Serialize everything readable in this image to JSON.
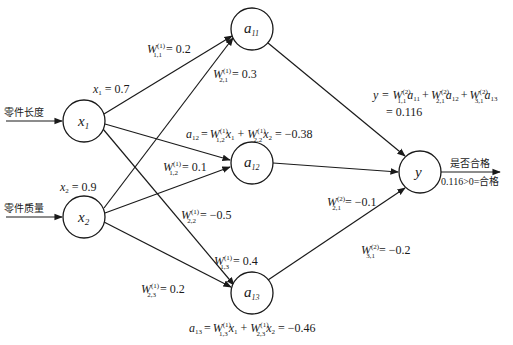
{
  "diagram": {
    "inputs": [
      {
        "id": "x1",
        "label_main": "x",
        "label_sub": "1",
        "feature": "零件长度",
        "value_text": "x",
        "value_sub": "1",
        "value": "= 0.7"
      },
      {
        "id": "x2",
        "label_main": "x",
        "label_sub": "2",
        "feature": "零件质量",
        "value_text": "x",
        "value_sub": "2",
        "value": "= 0.9"
      }
    ],
    "hidden": [
      {
        "id": "a11",
        "label_main": "a",
        "label_sub": "11"
      },
      {
        "id": "a12",
        "label_main": "a",
        "label_sub": "12",
        "formula": {
          "lhs": "a",
          "lhs_sub": "12",
          "t1": "W",
          "t1_sub": "1,2",
          "t1_sup": "(1)",
          "v1": "x",
          "v1_sub": "1",
          "t2": "W",
          "t2_sub": "2,2",
          "t2_sup": "(1)",
          "v2": "x",
          "v2_sub": "2",
          "result": "= −0.38"
        }
      },
      {
        "id": "a13",
        "label_main": "a",
        "label_sub": "13",
        "formula": {
          "lhs": "a",
          "lhs_sub": "13",
          "t1": "W",
          "t1_sub": "1,3",
          "t1_sup": "(1)",
          "v1": "x",
          "v1_sub": "1",
          "t2": "W",
          "t2_sub": "2,3",
          "t2_sup": "(1)",
          "v2": "x",
          "v2_sub": "2",
          "result": "= −0.46"
        }
      }
    ],
    "output": {
      "id": "y",
      "label": "y",
      "decision_label": "是否合格",
      "decision_result": "0.116>0=合格",
      "formula_line1": {
        "lhs": "y =",
        "terms": [
          {
            "w": "W",
            "sub": "1,1",
            "sup": "(2)",
            "a": "a",
            "a_sub": "11"
          },
          {
            "w": "W",
            "sub": "2,1",
            "sup": "(2)",
            "a": "a",
            "a_sub": "12"
          },
          {
            "w": "W",
            "sub": "3,1",
            "sup": "(2)",
            "a": "a",
            "a_sub": "13"
          }
        ]
      },
      "formula_line2": "= 0.116"
    },
    "weights_layer1": [
      {
        "name": "W",
        "sub": "1,1",
        "sup": "(1)",
        "value": "= 0.2"
      },
      {
        "name": "W",
        "sub": "2,1",
        "sup": "(1)",
        "value": "= 0.3"
      },
      {
        "name": "W",
        "sub": "1,2",
        "sup": "(1)",
        "value": "= 0.1"
      },
      {
        "name": "W",
        "sub": "2,2",
        "sup": "(1)",
        "value": "= −0.5"
      },
      {
        "name": "W",
        "sub": "1,3",
        "sup": "(1)",
        "value": "= 0.4"
      },
      {
        "name": "W",
        "sub": "2,3",
        "sup": "(1)",
        "value": "= 0.2"
      }
    ],
    "weights_layer2": [
      {
        "name": "W",
        "sub": "2,1",
        "sup": "(2)",
        "value": "= −0.1"
      },
      {
        "name": "W",
        "sub": "3,1",
        "sup": "(2)",
        "value": "= −0.2"
      }
    ],
    "plus": "+"
  }
}
